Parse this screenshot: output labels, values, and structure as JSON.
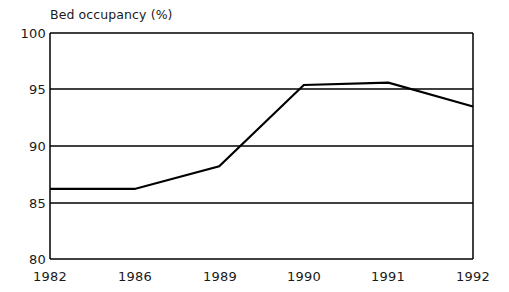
{
  "chart_data": {
    "type": "line",
    "title": "Bed occupancy (%)",
    "xlabel": "",
    "ylabel": "",
    "categories": [
      "1982",
      "1986",
      "1989",
      "1990",
      "1991",
      "1992"
    ],
    "values": [
      86.2,
      86.2,
      88.2,
      95.4,
      95.6,
      93.5
    ],
    "series": [
      {
        "name": "Bed occupancy",
        "values": [
          86.2,
          86.2,
          88.2,
          95.4,
          95.6,
          93.5
        ]
      }
    ],
    "ylim": [
      80,
      100
    ],
    "yticks": [
      80,
      85,
      90,
      95,
      100
    ],
    "ytick_labels": [
      "80",
      "85",
      "90",
      "95",
      "100"
    ],
    "xtick_labels": [
      "1982",
      "1986",
      "1989",
      "1990",
      "1991",
      "1992"
    ],
    "grid": "horizontal",
    "legend": "none",
    "line_color": "#000000",
    "axis_color": "#000000",
    "background_color": "#ffffff"
  }
}
